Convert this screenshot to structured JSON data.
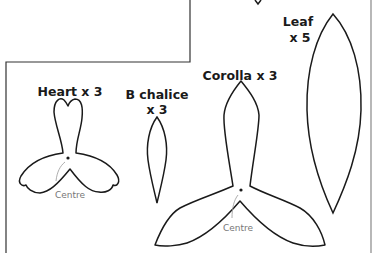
{
  "diagram": {
    "type": "sewing-pattern-template",
    "colors": {
      "outline": "#1a1a1a",
      "frame": "#333333",
      "right_border": "#888888",
      "annotation": "#777777",
      "background": "#ffffff"
    },
    "pieces": [
      {
        "id": "heart",
        "label": "Heart x 3",
        "centre_label": "Centre"
      },
      {
        "id": "b-chalice",
        "label_line1": "B chalice",
        "label_line2": "x 3"
      },
      {
        "id": "corolla",
        "label": "Corolla x 3",
        "centre_label": "Centre"
      },
      {
        "id": "leaf",
        "label_line1": "Leaf",
        "label_line2": "x 5"
      }
    ]
  }
}
